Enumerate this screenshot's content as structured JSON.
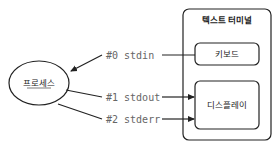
{
  "process": {
    "label": "프로세스"
  },
  "terminal": {
    "title": "텍스트 터미널",
    "keyboard_label": "키보드",
    "display_label": "디스플레이"
  },
  "streams": [
    {
      "fd": "#0",
      "name": "stdin",
      "label": "#0 stdin",
      "direction": "keyboard-to-process"
    },
    {
      "fd": "#1",
      "name": "stdout",
      "label": "#1 stdout",
      "direction": "process-to-display"
    },
    {
      "fd": "#2",
      "name": "stderr",
      "label": "#2 stderr",
      "direction": "process-to-display"
    }
  ],
  "colors": {
    "line": "#222222",
    "label": "#666666",
    "background": "#ffffff"
  }
}
